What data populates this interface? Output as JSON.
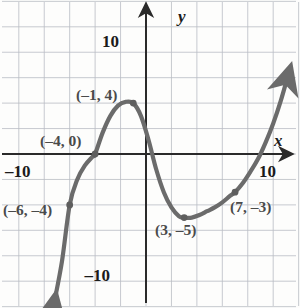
{
  "figure": {
    "title": "",
    "background": "#fdfdfc",
    "curve_color": "#6b6b6b",
    "grid_color": "#b9bcc4",
    "axis_color": "#2a2a2a",
    "label_color": "#4a4a4a"
  },
  "axes": {
    "x_name": "x",
    "y_name": "y",
    "x_tick_labels": [
      {
        "text": "–10",
        "value": -10
      },
      {
        "text": "10",
        "value": 10
      }
    ],
    "y_tick_labels": [
      {
        "text": "10",
        "value": 10
      },
      {
        "text": "–10",
        "value": -10
      }
    ],
    "xlim": [
      -11.5,
      12.2
    ],
    "ylim": [
      -12.1,
      12.1
    ],
    "grid_step": 2,
    "grid": true,
    "arrows": [
      "up",
      "right"
    ]
  },
  "chart_data": {
    "type": "line",
    "title": "",
    "xlabel": "x",
    "ylabel": "y",
    "xlim": [
      -11.5,
      12.2
    ],
    "ylim": [
      -12.1,
      12.1
    ],
    "grid": true,
    "legend": "none",
    "annotations": [
      {
        "text": "(–6, –4)",
        "x": -6,
        "y": -4
      },
      {
        "text": "(–4, 0)",
        "x": -4,
        "y": 0
      },
      {
        "text": "(–1, 4)",
        "x": -1,
        "y": 4
      },
      {
        "text": "(3, –5)",
        "x": 3,
        "y": -5
      },
      {
        "text": "(7, –3)",
        "x": 7,
        "y": -3
      }
    ],
    "marked_points": [
      {
        "x": -6,
        "y": -4
      },
      {
        "x": -4,
        "y": 0
      },
      {
        "x": -1,
        "y": 4
      },
      {
        "x": 3,
        "y": -5
      },
      {
        "x": 7,
        "y": -3
      }
    ],
    "series": [
      {
        "name": "cubic curve",
        "x": [
          -7.2,
          -6.6,
          -6.0,
          -5.4,
          -4.8,
          -4.2,
          -4.0,
          -3.4,
          -2.8,
          -2.2,
          -1.6,
          -1.0,
          -0.4,
          0.2,
          0.8,
          1.4,
          2.0,
          2.6,
          3.0,
          3.6,
          4.2,
          4.8,
          5.4,
          6.0,
          6.6,
          7.0,
          7.6,
          8.2,
          8.8,
          9.4,
          10.0,
          10.6,
          11.2
        ],
        "y": [
          -11.6,
          -8.4,
          -4.0,
          -2.0,
          -0.9,
          -0.2,
          0.0,
          1.7,
          3.0,
          3.8,
          4.1,
          4.0,
          3.0,
          1.1,
          -1.2,
          -3.0,
          -4.2,
          -4.9,
          -5.0,
          -5.0,
          -4.8,
          -4.5,
          -4.2,
          -3.8,
          -3.3,
          -3.0,
          -2.3,
          -1.4,
          -0.4,
          0.9,
          2.4,
          4.2,
          6.3
        ]
      }
    ]
  }
}
